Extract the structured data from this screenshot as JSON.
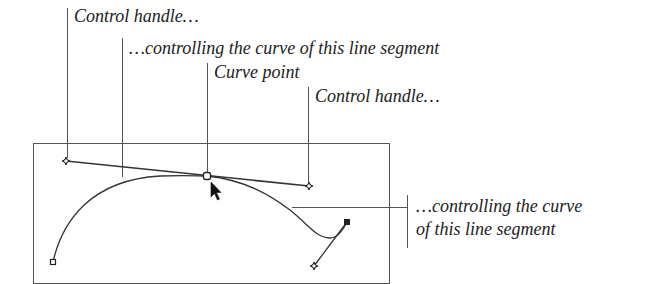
{
  "colors": {
    "line": "#444444",
    "text": "#222222",
    "background": "#ffffff"
  },
  "labels": {
    "control_handle_left": "Control handle…",
    "controlling_segment_top": "…controlling the curve of this line segment",
    "curve_point": "Curve point",
    "control_handle_right": "Control handle…",
    "controlling_segment_right_line1": "…controlling the curve",
    "controlling_segment_right_line2": "of this line segment"
  },
  "diagram": {
    "frame": {
      "x": 33,
      "y": 143,
      "width": 356,
      "height": 140
    },
    "curve_point": {
      "x": 207,
      "y": 176
    },
    "left_handle": {
      "x": 66,
      "y": 161
    },
    "right_handle": {
      "x": 309,
      "y": 186
    },
    "start_anchor": {
      "x": 53,
      "y": 262
    },
    "end_anchor": {
      "x": 347,
      "y": 222
    },
    "end_handle": {
      "x": 314,
      "y": 266
    },
    "cursor": "arrow-pointer"
  }
}
